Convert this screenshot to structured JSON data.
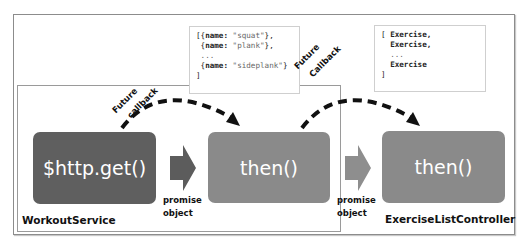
{
  "diagram": {
    "outer_container": {
      "label": ""
    },
    "service_container": {
      "label": "WorkoutService"
    },
    "controller_label": "ExerciseListController",
    "blocks": [
      {
        "id": "http-get",
        "label": "$http.get()",
        "color": "#5f5f5f"
      },
      {
        "id": "then-service",
        "label": "then()",
        "color": "#8a8a8a"
      },
      {
        "id": "then-controller",
        "label": "then()",
        "color": "#8a8a8a"
      }
    ],
    "arrows": [
      {
        "from": "http-get",
        "to": "then-service",
        "label_line1": "promise",
        "label_line2": "object"
      },
      {
        "from": "then-service",
        "to": "then-controller",
        "label_line1": "promise",
        "label_line2": "object"
      }
    ],
    "callbacks": [
      {
        "label_line1": "Future",
        "label_line2": "callback"
      },
      {
        "label_line1": "Future",
        "label_line2": "Callback"
      }
    ],
    "data_boxes": [
      {
        "lines": [
          {
            "prefix": "[{",
            "key": "name:",
            "value": " \"squat\"",
            "suffix": "},"
          },
          {
            "prefix": " {",
            "key": "name:",
            "value": " \"plank\"",
            "suffix": "},"
          },
          {
            "prefix": " ...",
            "key": "",
            "value": "",
            "suffix": ""
          },
          {
            "prefix": " {",
            "key": "name:",
            "value": " \"sideplank\"",
            "suffix": "}"
          },
          {
            "prefix": "]",
            "key": "",
            "value": "",
            "suffix": ""
          }
        ]
      },
      {
        "lines": [
          {
            "prefix": "[ ",
            "key": "Exercise,",
            "value": "",
            "suffix": ""
          },
          {
            "prefix": "  ",
            "key": "Exercise,",
            "value": "",
            "suffix": ""
          },
          {
            "prefix": "  ...",
            "key": "",
            "value": "",
            "suffix": ""
          },
          {
            "prefix": "  ",
            "key": "Exercise",
            "value": "",
            "suffix": ""
          },
          {
            "prefix": "]",
            "key": "",
            "value": "",
            "suffix": ""
          }
        ]
      }
    ]
  }
}
